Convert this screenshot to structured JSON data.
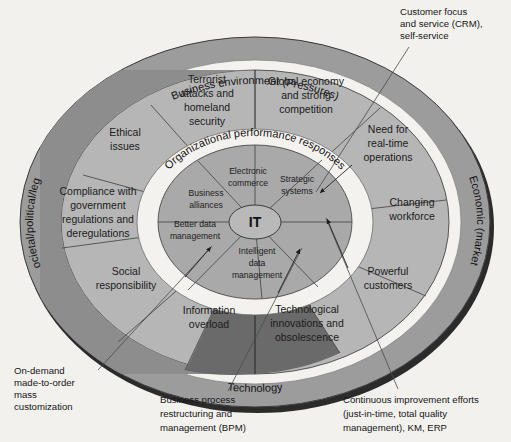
{
  "figure": {
    "center_label": "IT",
    "background_color": "#f3f1ee"
  },
  "colors": {
    "outer_ring": "#9a9a9a",
    "outer_ring_dark": "#5d5d5d",
    "gap_ring": "#f2f0ed",
    "pressure_dark": "#8c8c8c",
    "pressure_light": "#b4b4b4",
    "pressure_darkest": "#6b6b6b",
    "response_fill": "#a8a8a8",
    "response_band": "#f4f2ef",
    "shadow": "#1a1a1a",
    "text": "#1b1b1b"
  },
  "rings": {
    "outer_labels": [
      {
        "id": "top",
        "text": "Business environment (Pressures)"
      },
      {
        "id": "left",
        "text": "Societal/political/legal"
      },
      {
        "id": "right",
        "text": "Economic (market)"
      },
      {
        "id": "bottom",
        "text": "Technology"
      }
    ],
    "inner_band_label": "Organizational performance responses"
  },
  "pressures": [
    {
      "index": 0,
      "label": "Terrorist attacks and homeland security",
      "lines": [
        "Terrorist",
        "attacks and",
        "homeland",
        "security"
      ],
      "tone": "dark"
    },
    {
      "index": 1,
      "label": "Global economy and strong competition",
      "lines": [
        "Global economy",
        "and strong",
        "competition"
      ],
      "tone": "light"
    },
    {
      "index": 2,
      "label": "Need for real-time operations",
      "lines": [
        "Need for",
        "real-time",
        "operations"
      ],
      "tone": "light"
    },
    {
      "index": 3,
      "label": "Changing workforce",
      "lines": [
        "Changing",
        "workforce"
      ],
      "tone": "light"
    },
    {
      "index": 4,
      "label": "Powerful customers",
      "lines": [
        "Powerful",
        "customers"
      ],
      "tone": "light"
    },
    {
      "index": 5,
      "label": "Technological innovations and obsolescence",
      "lines": [
        "Technological",
        "innovations and",
        "obsolescence"
      ],
      "tone": "darkest"
    },
    {
      "index": 6,
      "label": "Information overload",
      "lines": [
        "Information",
        "overload"
      ],
      "tone": "darkest"
    },
    {
      "index": 7,
      "label": "Social responsibility",
      "lines": [
        "Social",
        "responsibility"
      ],
      "tone": "dark"
    },
    {
      "index": 8,
      "label": "Compliance with government regulations and deregulations",
      "lines": [
        "Compliance with",
        "government",
        "regulations and",
        "deregulations"
      ],
      "tone": "dark"
    },
    {
      "index": 9,
      "label": "Ethical issues",
      "lines": [
        "Ethical",
        "issues"
      ],
      "tone": "dark"
    }
  ],
  "responses": [
    {
      "index": 0,
      "label": "Electronic commerce",
      "lines": [
        "Electronic",
        "commerce"
      ]
    },
    {
      "index": 1,
      "label": "Strategic systems",
      "lines": [
        "Strategic",
        "systems"
      ]
    },
    {
      "index": 2,
      "label": "Business alliances",
      "lines": [
        "Business",
        "alliances"
      ]
    },
    {
      "index": 3,
      "label": "Better data management",
      "lines": [
        "Better data",
        "management"
      ]
    },
    {
      "index": 4,
      "label": "Intelligent data management",
      "lines": [
        "Intelligent",
        "data",
        "management"
      ]
    }
  ],
  "callouts": [
    {
      "id": "crm",
      "lines": [
        "Customer focus",
        "and service (CRM),",
        "self-service"
      ],
      "text": "Customer focus and service (CRM), self-service"
    },
    {
      "id": "on-demand",
      "lines": [
        "On-demand",
        "made-to-order",
        "mass",
        "customization"
      ],
      "text": "On-demand made-to-order mass customization"
    },
    {
      "id": "bpm",
      "lines": [
        "Business process",
        "restructuring and",
        "management (BPM)"
      ],
      "text": "Business process restructuring and management (BPM)"
    },
    {
      "id": "continuous-improvement",
      "lines": [
        "Continuous improvement efforts",
        "(just-in-time, total quality",
        "management), KM, ERP"
      ],
      "text": "Continuous improvement efforts (just-in-time, total quality management), KM, ERP"
    }
  ]
}
